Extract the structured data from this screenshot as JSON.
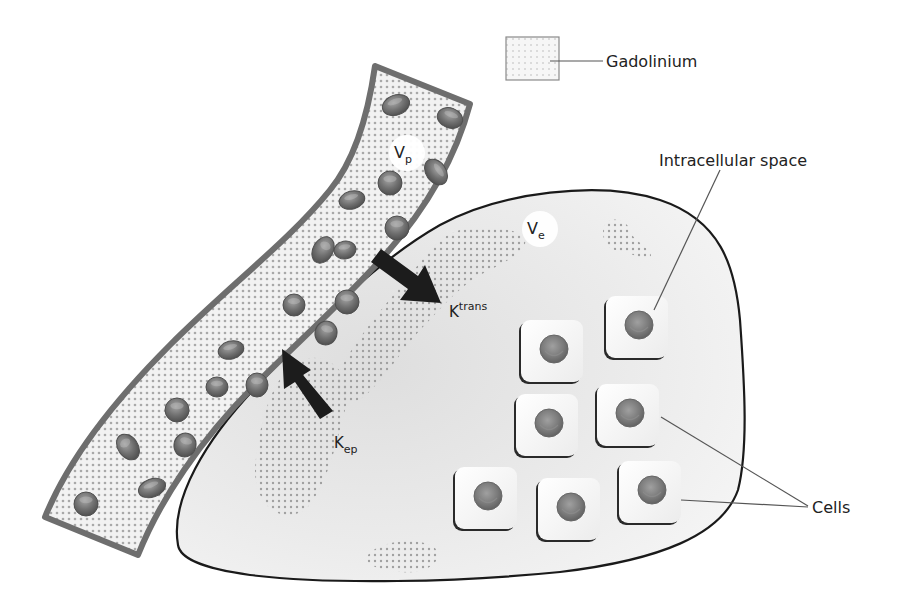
{
  "diagram": {
    "type": "pharmacokinetic-compartment-diagram",
    "colors": {
      "background": "#ffffff",
      "vessel_outline": "#6e6e6e",
      "vessel_fill": "#f1f1f1",
      "dots": "#a8a8a8",
      "tissue_outline": "#1a1a1a",
      "tissue_fill": "#ececec",
      "arrow": "#1c1c1c",
      "cell_fill": "#f6f6f6",
      "cell_shadow": "#2a2a2a",
      "nucleus": "#7a7a7a",
      "rbc": "#707070",
      "leader_line": "#555555",
      "text": "#222222"
    }
  },
  "legend": {
    "swatch_icon": "dotted-square-icon",
    "label": "Gadolinium"
  },
  "compartments": {
    "plasma": {
      "symbol": "V",
      "subscript": "p"
    },
    "extracellular": {
      "symbol": "V",
      "subscript": "e"
    }
  },
  "transfer": {
    "ktrans": {
      "symbol": "K",
      "superscript": "trans",
      "direction": "plasma-to-tissue"
    },
    "kep": {
      "symbol": "K",
      "subscript": "ep",
      "direction": "tissue-to-plasma"
    }
  },
  "annotations": {
    "intracellular": "Intracellular space",
    "cells": "Cells"
  },
  "cells": [
    {
      "x": 521,
      "y": 320
    },
    {
      "x": 606,
      "y": 296
    },
    {
      "x": 516,
      "y": 394
    },
    {
      "x": 597,
      "y": 384
    },
    {
      "x": 455,
      "y": 467
    },
    {
      "x": 538,
      "y": 478
    },
    {
      "x": 619,
      "y": 461
    }
  ],
  "red_blood_cells": [
    {
      "cx": 396,
      "cy": 105,
      "rx": 14,
      "ry": 10,
      "rot": -20
    },
    {
      "cx": 450,
      "cy": 118,
      "rx": 13,
      "ry": 10,
      "rot": 20
    },
    {
      "cx": 436,
      "cy": 172,
      "rx": 14,
      "ry": 10,
      "rot": 55
    },
    {
      "cx": 390,
      "cy": 183,
      "rx": 12,
      "ry": 12,
      "rot": 0
    },
    {
      "cx": 352,
      "cy": 200,
      "rx": 13,
      "ry": 9,
      "rot": -15
    },
    {
      "cx": 397,
      "cy": 228,
      "rx": 12,
      "ry": 12,
      "rot": 0
    },
    {
      "cx": 345,
      "cy": 250,
      "rx": 11,
      "ry": 9,
      "rot": -10
    },
    {
      "cx": 323,
      "cy": 250,
      "rx": 10,
      "ry": 14,
      "rot": 30
    },
    {
      "cx": 294,
      "cy": 305,
      "rx": 11,
      "ry": 11,
      "rot": 0
    },
    {
      "cx": 347,
      "cy": 302,
      "rx": 12,
      "ry": 12,
      "rot": 0
    },
    {
      "cx": 326,
      "cy": 333,
      "rx": 11,
      "ry": 12,
      "rot": 15
    },
    {
      "cx": 231,
      "cy": 350,
      "rx": 13,
      "ry": 9,
      "rot": -15
    },
    {
      "cx": 217,
      "cy": 387,
      "rx": 11,
      "ry": 10,
      "rot": 0
    },
    {
      "cx": 257,
      "cy": 385,
      "rx": 11,
      "ry": 12,
      "rot": 0
    },
    {
      "cx": 177,
      "cy": 410,
      "rx": 12,
      "ry": 12,
      "rot": 0
    },
    {
      "cx": 128,
      "cy": 447,
      "rx": 10,
      "ry": 14,
      "rot": -35
    },
    {
      "cx": 185,
      "cy": 445,
      "rx": 11,
      "ry": 12,
      "rot": 15
    },
    {
      "cx": 176,
      "cy": 410,
      "rx": 0,
      "ry": 0,
      "rot": 0
    },
    {
      "cx": 185,
      "cy": 412,
      "rx": 0,
      "ry": 0,
      "rot": 0
    },
    {
      "cx": 152,
      "cy": 488,
      "rx": 14,
      "ry": 9,
      "rot": -20
    },
    {
      "cx": 86,
      "cy": 504,
      "rx": 12,
      "ry": 12,
      "rot": 0
    },
    {
      "cx": 176,
      "cy": 413,
      "rx": 0,
      "ry": 0,
      "rot": 0
    }
  ]
}
